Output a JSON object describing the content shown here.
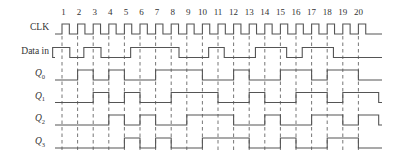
{
  "diagram": {
    "type": "timing-diagram",
    "clock_pulse_numbers": [
      "1",
      "2",
      "3",
      "4",
      "5",
      "6",
      "7",
      "8",
      "9",
      "10",
      "11",
      "12",
      "13",
      "14",
      "15",
      "16",
      "17",
      "18",
      "19",
      "20"
    ],
    "signals": [
      {
        "id": "clk",
        "label": "CLK",
        "subscript": ""
      },
      {
        "id": "data_in",
        "label": "Data in",
        "subscript": ""
      },
      {
        "id": "q0",
        "label": "Q",
        "subscript": "0"
      },
      {
        "id": "q1",
        "label": "Q",
        "subscript": "1"
      },
      {
        "id": "q2",
        "label": "Q",
        "subscript": "2"
      },
      {
        "id": "q3",
        "label": "Q",
        "subscript": "3"
      }
    ],
    "waveforms": {
      "data_in_high_intervals": [
        [
          0.4,
          1.5
        ],
        [
          2.4,
          3.5
        ],
        [
          5.4,
          8.5
        ],
        [
          10.4,
          11.4
        ],
        [
          13.4,
          15.4
        ],
        [
          16.4,
          18.4
        ]
      ],
      "q0_high_intervals": [
        [
          2,
          3
        ],
        [
          4,
          5
        ],
        [
          7,
          10
        ],
        [
          12,
          13
        ],
        [
          15,
          17
        ],
        [
          18,
          20
        ]
      ],
      "q1_high_intervals": [
        [
          3,
          4
        ],
        [
          5,
          6
        ],
        [
          8,
          11
        ],
        [
          13,
          14
        ],
        [
          16,
          18
        ],
        [
          19,
          21.3
        ]
      ],
      "q2_high_intervals": [
        [
          4,
          5
        ],
        [
          6,
          7
        ],
        [
          9,
          12
        ],
        [
          14,
          15
        ],
        [
          17,
          19
        ],
        [
          20,
          21.3
        ]
      ],
      "q3_high_intervals": [
        [
          5,
          6
        ],
        [
          7,
          8
        ],
        [
          10,
          13
        ],
        [
          15,
          16
        ],
        [
          18,
          20
        ]
      ]
    },
    "colors": {
      "line": "#555555",
      "text": "#333333",
      "background": "#ffffff"
    }
  }
}
